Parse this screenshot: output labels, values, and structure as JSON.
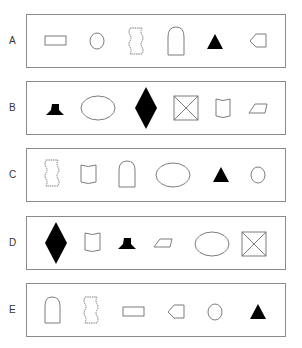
{
  "figure": {
    "rows": [
      {
        "label": "A",
        "shapes": [
          "rectangle",
          "circle",
          "wavy-rectangle",
          "arch",
          "filled-triangle",
          "pentagon-left"
        ]
      },
      {
        "label": "B",
        "shapes": [
          "filled-pedestal",
          "ellipse",
          "filled-diamond",
          "crossed-square",
          "cup",
          "parallelogram"
        ]
      },
      {
        "label": "C",
        "shapes": [
          "wavy-rectangle",
          "cup",
          "arch",
          "ellipse",
          "filled-triangle",
          "circle"
        ]
      },
      {
        "label": "D",
        "shapes": [
          "filled-diamond",
          "cup",
          "filled-pedestal",
          "parallelogram",
          "ellipse",
          "crossed-square"
        ]
      },
      {
        "label": "E",
        "shapes": [
          "arch",
          "wavy-rectangle",
          "rectangle",
          "pentagon-left",
          "circle",
          "filled-triangle"
        ]
      }
    ],
    "colors": {
      "stroke": "#6e6e6e",
      "fill": "#000000",
      "border": "#8a8a8a"
    }
  }
}
